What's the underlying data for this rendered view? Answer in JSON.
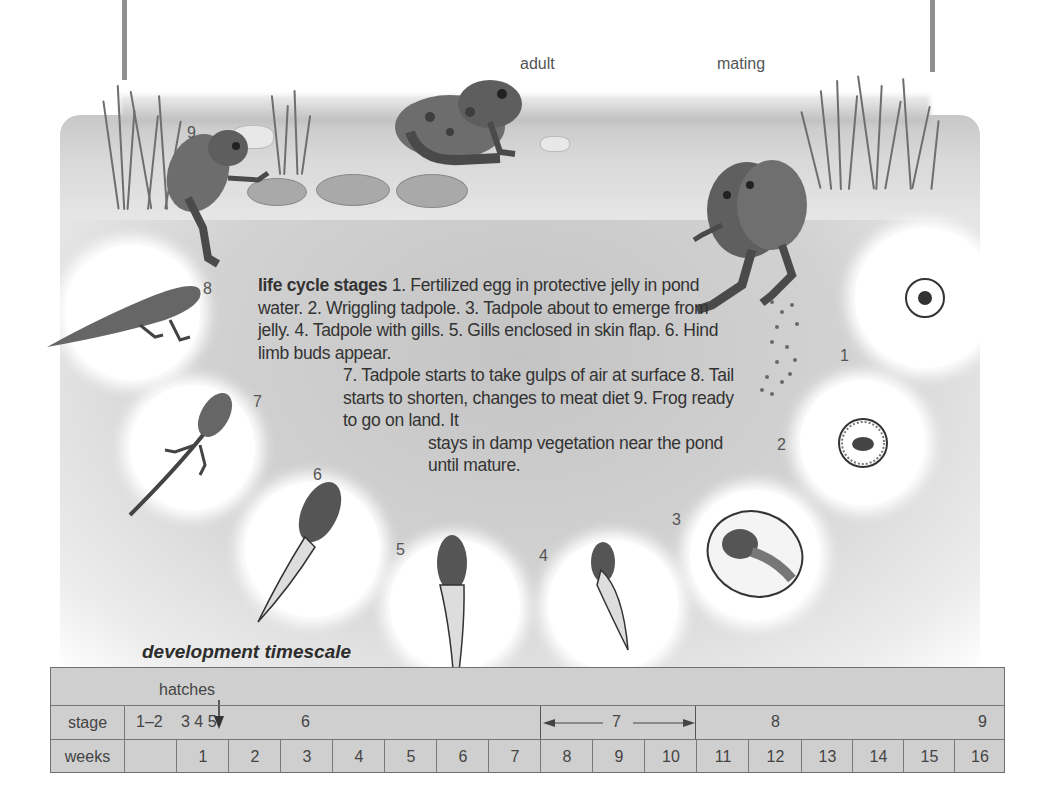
{
  "scene": {
    "labels": {
      "adult": "adult",
      "mating": "mating"
    },
    "stage_markers": [
      {
        "stage": "1",
        "x": 840,
        "y": 347
      },
      {
        "stage": "2",
        "x": 777,
        "y": 436
      },
      {
        "stage": "3",
        "x": 672,
        "y": 511
      },
      {
        "stage": "4",
        "x": 539,
        "y": 547
      },
      {
        "stage": "5",
        "x": 396,
        "y": 541
      },
      {
        "stage": "6",
        "x": 313,
        "y": 466
      },
      {
        "stage": "7",
        "x": 253,
        "y": 393
      },
      {
        "stage": "8",
        "x": 203,
        "y": 280
      },
      {
        "stage": "9",
        "x": 187,
        "y": 124
      }
    ]
  },
  "description": {
    "heading": "life cycle stages",
    "line1": " 1. Fertilized egg in protective jelly in pond water. 2. Wriggling tadpole. 3. Tadpole about to emerge from jelly. 4. Tadpole with gills. 5. Gills enclosed in skin flap. 6. Hind limb buds appear.",
    "line2": "7. Tadpole starts to take gulps of air at surface 8. Tail starts to shorten, changes to meat diet 9. Frog ready to go on land. It",
    "line3": "stays in damp vegetation near the pond until mature."
  },
  "timescale": {
    "title": "development timescale",
    "hatches_label": "hatches",
    "stage_row": {
      "header": "stage",
      "early_stages": "1–2",
      "stages_345": "3 4 5",
      "stage6": "6",
      "stage7": "7",
      "stage8": "8",
      "stage9": "9"
    },
    "weeks_row": {
      "header": "weeks",
      "weeks": [
        "",
        "1",
        "2",
        "3",
        "4",
        "5",
        "6",
        "7",
        "8",
        "9",
        "10",
        "11",
        "12",
        "13",
        "14",
        "15",
        "16"
      ]
    }
  },
  "stages_list": [
    {
      "n": 1,
      "text": "Fertilized egg in protective jelly in pond water."
    },
    {
      "n": 2,
      "text": "Wriggling tadpole."
    },
    {
      "n": 3,
      "text": "Tadpole about to emerge from jelly."
    },
    {
      "n": 4,
      "text": "Tadpole with gills."
    },
    {
      "n": 5,
      "text": "Gills enclosed in skin flap."
    },
    {
      "n": 6,
      "text": "Hind limb buds appear."
    },
    {
      "n": 7,
      "text": "Tadpole starts to take gulps of air at surface"
    },
    {
      "n": 8,
      "text": "Tail starts to shorten, changes to meat diet"
    },
    {
      "n": 9,
      "text": "Frog ready to go on land. It stays in damp vegetation near the pond until mature."
    }
  ]
}
